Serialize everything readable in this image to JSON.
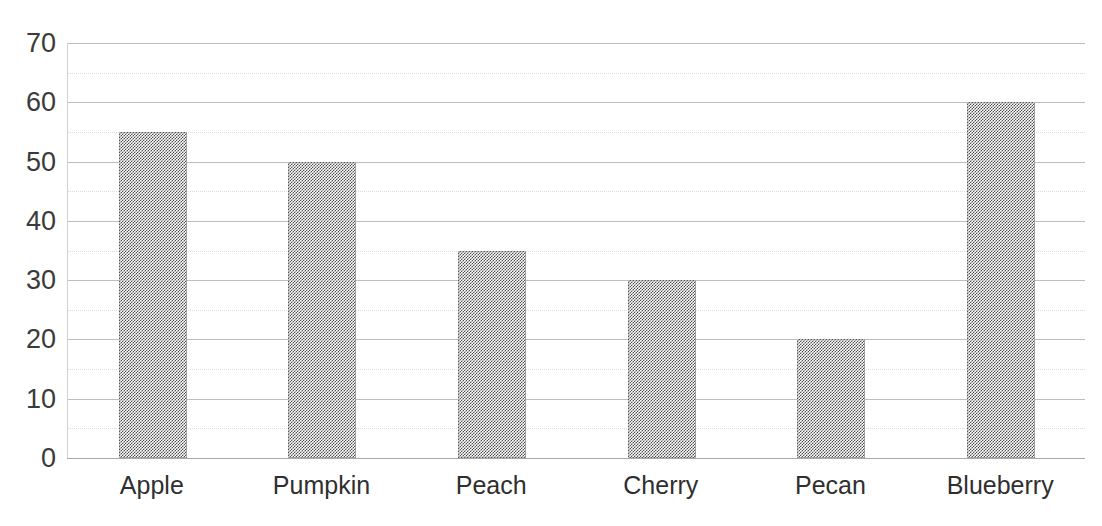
{
  "chart_data": {
    "type": "bar",
    "title": "Pieces of Pie Sold",
    "xlabel": "",
    "ylabel": "",
    "categories": [
      "Apple",
      "Pumpkin",
      "Peach",
      "Cherry",
      "Pecan",
      "Blueberry"
    ],
    "values": [
      55,
      50,
      35,
      30,
      20,
      60
    ],
    "ylim": [
      0,
      70
    ],
    "y_ticks": [
      0,
      10,
      20,
      30,
      40,
      50,
      60,
      70
    ],
    "y_tick_labels": [
      "0",
      "10",
      "20",
      "30",
      "40",
      "50",
      "60",
      "70"
    ],
    "minor_y_ticks": [
      5,
      15,
      25,
      35,
      45,
      55,
      65
    ],
    "grid": true,
    "minor_grid": true,
    "legend": false,
    "legend_position": "none",
    "series": [
      {
        "name": "Pieces of Pie Sold",
        "values": [
          55,
          50,
          35,
          30,
          20,
          60
        ]
      }
    ],
    "colors": {
      "bar_fill": "#6b6b6b",
      "bar_pattern": "#4f4f4f",
      "gridline_major": "#bdbdbd",
      "gridline_minor": "#dcdcdc",
      "axis": "#a8a8a8",
      "text": "#2f2f2f",
      "background": "#ffffff"
    }
  }
}
